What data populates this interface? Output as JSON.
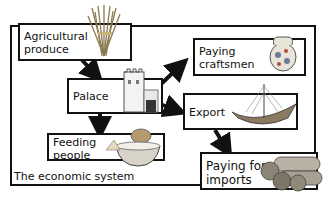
{
  "diagram": {
    "title": "The economic system",
    "nodes": [
      {
        "id": "agri",
        "label_line1": "Agricultural",
        "label_line2": "produce",
        "icon": "wheat-sheaf-icon"
      },
      {
        "id": "palace",
        "label": "Palace",
        "icon": "palace-tower-icon"
      },
      {
        "id": "craftsmen",
        "label_line1": "Paying",
        "label_line2": "craftsmen",
        "icon": "decorated-jug-icon"
      },
      {
        "id": "export",
        "label": "Export",
        "icon": "sailing-ship-icon"
      },
      {
        "id": "feeding",
        "label_line1": "Feeding",
        "label_line2": "people",
        "icon": "food-bowl-icon"
      },
      {
        "id": "imports",
        "label_line1": "Paying for",
        "label_line2": "imports",
        "icon": "timber-logs-icon"
      }
    ],
    "edges": [
      {
        "from": "agri",
        "to": "palace"
      },
      {
        "from": "palace",
        "to": "craftsmen"
      },
      {
        "from": "palace",
        "to": "export"
      },
      {
        "from": "palace",
        "to": "feeding"
      },
      {
        "from": "export",
        "to": "imports"
      }
    ]
  }
}
